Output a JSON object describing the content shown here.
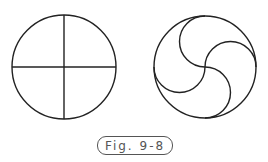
{
  "figure": {
    "caption": "Fig. 9-8",
    "left_diagram": {
      "type": "circle-with-cross",
      "cx": 64,
      "cy": 67,
      "r": 52
    },
    "right_diagram": {
      "type": "circle-with-pinwheel-arcs",
      "cx": 205,
      "cy": 67,
      "r": 51
    },
    "stroke_color": "#222222"
  }
}
